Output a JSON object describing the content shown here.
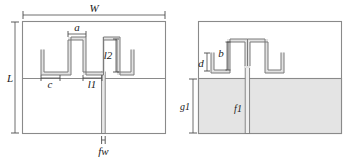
{
  "figure": {
    "type": "antenna-geometry-diagram",
    "views": [
      {
        "id": "front",
        "name": "front-view",
        "labels": {
          "width": "W",
          "length": "L",
          "stub_width": "a",
          "arm_width": "c",
          "arm_length": "l1",
          "arm_height": "l2",
          "feed_width": "fw"
        }
      },
      {
        "id": "back",
        "name": "back-view",
        "labels": {
          "gap": "d",
          "stub": "b",
          "ground_height": "g1",
          "feed_length": "f1"
        }
      }
    ],
    "colors": {
      "ground": "#e4e4e4",
      "trace": "#e2e2e2",
      "outline": "#7b7b7b",
      "border": "#8a8a8a",
      "dimension": "#4a4a4a",
      "background": "#ffffff",
      "text": "#1a1a1a"
    }
  },
  "labels": {
    "W": "W",
    "L": "L",
    "a": "a",
    "c": "c",
    "l1": "l1",
    "l2": "l2",
    "fw": "fw",
    "d": "d",
    "b": "b",
    "g1": "g1",
    "f1": "f1"
  }
}
